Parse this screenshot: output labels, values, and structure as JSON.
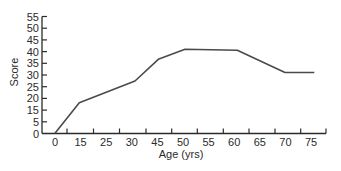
{
  "chart_data": {
    "type": "line",
    "title": "",
    "xlabel": "Age (yrs)",
    "ylabel": "Score",
    "x_tick_labels": [
      "0",
      "15",
      "25",
      "30",
      "45",
      "50",
      "55",
      "60",
      "65",
      "70",
      "75"
    ],
    "y_tick_labels": [
      "0",
      "5",
      "15",
      "20",
      "25",
      "30",
      "35",
      "40",
      "45",
      "50",
      "55"
    ],
    "grid": false,
    "legend": null,
    "series": [
      {
        "name": "Score",
        "color": "#4a4a4a",
        "points": [
          {
            "x": 0,
            "y": 0
          },
          {
            "x": 15,
            "y": 18
          },
          {
            "x": 32,
            "y": 27.5
          },
          {
            "x": 45,
            "y": 37
          },
          {
            "x": 51,
            "y": 41
          },
          {
            "x": 61,
            "y": 41
          },
          {
            "x": 70,
            "y": 31
          },
          {
            "x": 76,
            "y": 31
          }
        ]
      }
    ],
    "layout": {
      "axis_color": "#2b2b2b",
      "line_color": "#4a4a4a",
      "plot_left": 42,
      "plot_bottom": 133.5,
      "plot_right": 326,
      "y_tick_top": 16.5,
      "x_label_first": 55,
      "x_label_step": 25.6,
      "x_ticks_px": [
        67,
        93.5,
        119.5,
        146,
        171.7,
        197.3,
        223.3,
        249,
        275,
        300.7,
        326
      ],
      "line_px": [
        [
          55,
          133.3
        ],
        [
          79.3,
          102.7
        ],
        [
          135,
          81
        ],
        [
          158.3,
          59.3
        ],
        [
          185,
          49.3
        ],
        [
          237.3,
          50.3
        ],
        [
          285,
          72.5
        ],
        [
          314.3,
          72.5
        ]
      ]
    }
  }
}
